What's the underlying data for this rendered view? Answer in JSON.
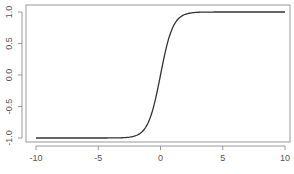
{
  "chart_data": {
    "type": "line",
    "title": "",
    "xlabel": "",
    "ylabel": "",
    "xlim": [
      -10,
      10
    ],
    "ylim": [
      -1,
      1
    ],
    "grid": false,
    "legend": null,
    "x_ticks": [
      -10,
      -5,
      0,
      5,
      10
    ],
    "x_tick_labels": [
      "-10",
      "-5",
      "0",
      "5",
      "10"
    ],
    "y_ticks": [
      -1.0,
      -0.5,
      0.0,
      0.5,
      1.0
    ],
    "y_tick_labels": [
      "-1.0",
      "-0.5",
      "0.0",
      "0.5",
      "1.0"
    ],
    "series": [
      {
        "name": "tanh(x)",
        "color": "#333333",
        "x": [
          -10,
          -5,
          -4,
          -3,
          -2.5,
          -2,
          -1.5,
          -1,
          -0.5,
          0,
          0.5,
          1,
          1.5,
          2,
          2.5,
          3,
          4,
          5,
          10
        ],
        "y": [
          -1.0,
          -1.0,
          -0.999,
          -0.995,
          -0.987,
          -0.964,
          -0.905,
          -0.762,
          -0.462,
          0.0,
          0.462,
          0.762,
          0.905,
          0.964,
          0.987,
          0.995,
          0.999,
          1.0,
          1.0
        ]
      }
    ]
  }
}
